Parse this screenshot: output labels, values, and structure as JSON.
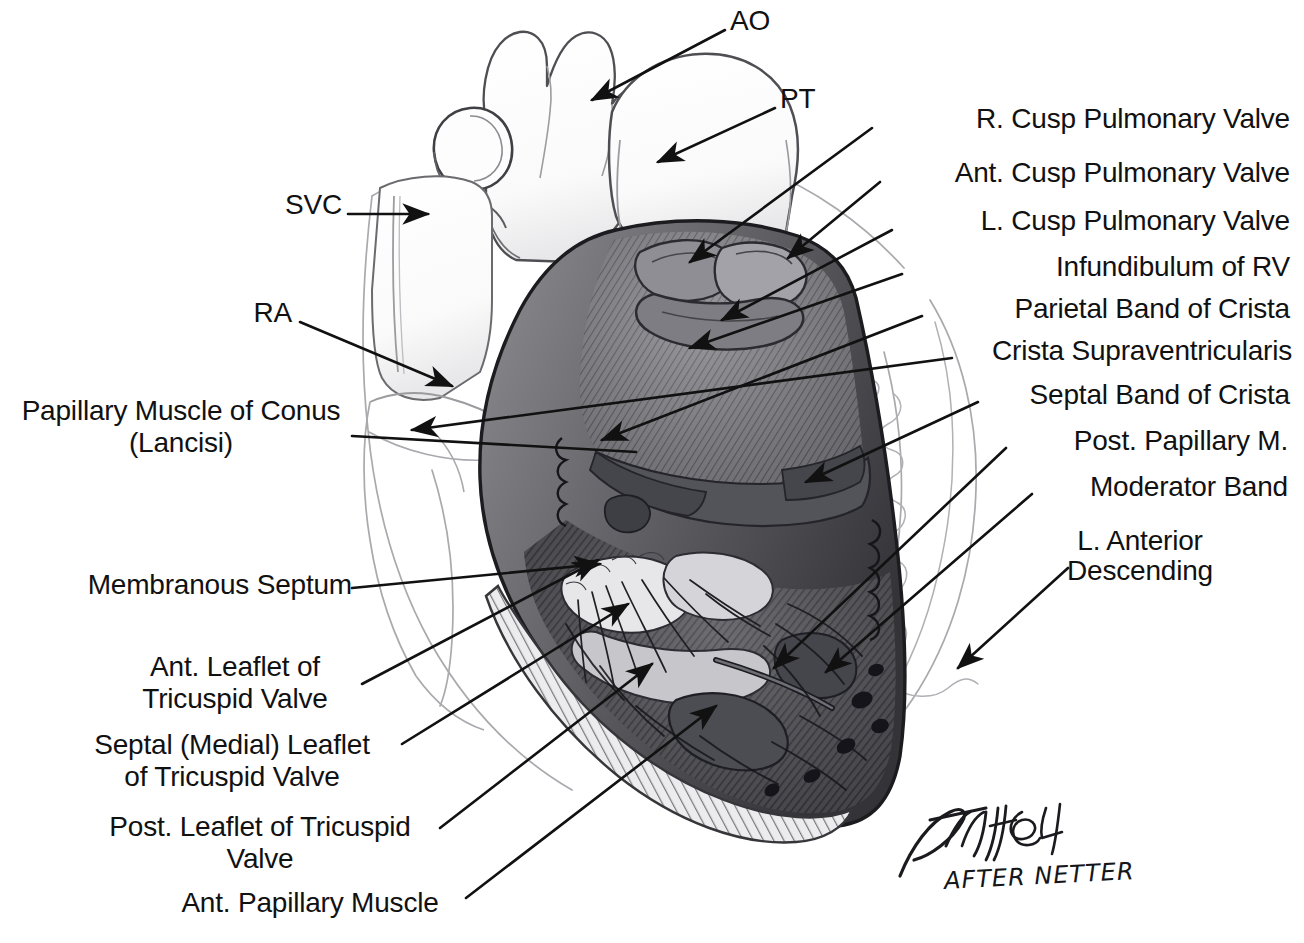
{
  "figure": {
    "medium": "pencil drawing",
    "background_color": "#ffffff",
    "ink_color": "#111111"
  },
  "labels": {
    "ao": "AO",
    "pt": "PT",
    "svc": "SVC",
    "ra": "RA",
    "r_cusp_pulmonary_valve": "R. Cusp Pulmonary Valve",
    "ant_cusp_pulmonary_valve": "Ant. Cusp Pulmonary Valve",
    "l_cusp_pulmonary_valve": "L. Cusp Pulmonary Valve",
    "infundibulum_of_rv": "Infundibulum of RV",
    "parietal_band_of_crista": "Parietal Band of Crista",
    "crista_supraventricularis": "Crista Supraventricularis",
    "septal_band_of_crista": "Septal Band of Crista",
    "post_papillary_m": "Post. Papillary M.",
    "moderator_band": "Moderator Band",
    "l_anterior_descending_line1": "L. Anterior",
    "l_anterior_descending_line2": "Descending",
    "papillary_muscle_of_conus_line1": "Papillary Muscle of Conus",
    "papillary_muscle_of_conus_line2": "(Lancisi)",
    "membranous_septum": "Membranous Septum",
    "ant_leaflet_tricuspid_line1": "Ant. Leaflet of",
    "ant_leaflet_tricuspid_line2": "Tricuspid Valve",
    "septal_leaflet_tricuspid_line1": "Septal (Medial) Leaflet",
    "septal_leaflet_tricuspid_line2": "of Tricuspid Valve",
    "post_leaflet_tricuspid_line1": "Post. Leaflet of Tricuspid",
    "post_leaflet_tricuspid_line2": "Valve",
    "ant_papillary_muscle": "Ant. Papillary Muscle"
  },
  "signature": {
    "artist": "Finch 84",
    "attribution": "AFTER NETTER"
  }
}
